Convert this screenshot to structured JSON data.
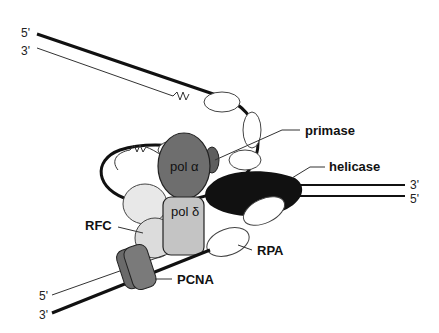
{
  "diagram": {
    "strand_ends": {
      "top_left_5": "5'",
      "top_left_3": "3'",
      "right_3": "3'",
      "right_5": "5'",
      "bottom_left_5": "5'",
      "bottom_left_3": "3'"
    },
    "proteins": {
      "pol_alpha": "pol α",
      "pol_delta": "pol δ"
    },
    "callouts": {
      "primase": "primase",
      "helicase": "helicase",
      "rfc": "RFC",
      "rpa": "RPA",
      "pcna": "PCNA"
    },
    "colors": {
      "pol_alpha": "#6e6e6e",
      "pol_delta": "#c4c4c4",
      "rfc": "#e0e0e0",
      "pcna": "#7a7a7a",
      "helicase": "#111111",
      "primase": "#5e5e5e",
      "rpa": "#ffffff"
    }
  }
}
